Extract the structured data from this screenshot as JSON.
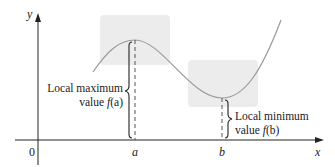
{
  "axes": {
    "x_label": "x",
    "y_label": "y",
    "origin_label": "0",
    "ticks": [
      {
        "label": "a",
        "x": 135
      },
      {
        "label": "b",
        "x": 222
      }
    ]
  },
  "annotations": {
    "local_max": {
      "line1": "Local maximum",
      "line2_prefix": "value ",
      "line2_func": "f",
      "line2_arg": "(a)"
    },
    "local_min": {
      "line1": "Local minimum",
      "line2_prefix": "value ",
      "line2_func": "f",
      "line2_arg": "(b)"
    }
  },
  "colors": {
    "axis": "#222222",
    "curve": "#9a9a9a",
    "highlight_box": "#ececec",
    "dashed_line": "#555555"
  }
}
